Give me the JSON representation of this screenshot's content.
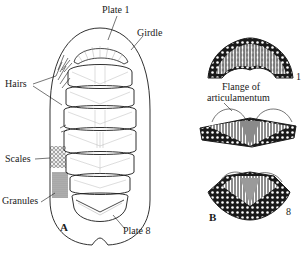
{
  "figure": {
    "panel_a": {
      "panel_label": "A",
      "labels": {
        "plate_1": "Plate 1",
        "girdle": "Girdle",
        "hairs": "Hairs",
        "scales": "Scales",
        "granules": "Granules",
        "plate_8": "Plate 8"
      }
    },
    "panel_b": {
      "panel_label": "B",
      "labels": {
        "plate_1_number": "1",
        "flange": "Flange of articulamentum",
        "flange_line1": "Flange of",
        "flange_line2": "articulamentum",
        "plate_8_number": "8"
      }
    },
    "colors": {
      "ink": "#1a1a1a",
      "background": "#ffffff",
      "shade": "#9a9a9a"
    }
  }
}
